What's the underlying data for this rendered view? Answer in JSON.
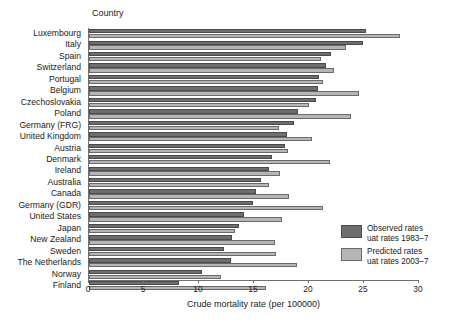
{
  "chart_data": {
    "type": "bar",
    "orientation": "horizontal",
    "title": "",
    "column_header": "Country",
    "xlabel": "Crude mortality rate (per 100000)",
    "ylabel": "",
    "xlim": [
      0,
      30
    ],
    "xticks": [
      0,
      5,
      10,
      15,
      20,
      25,
      30
    ],
    "xtick_labels": [
      "0",
      "5",
      "10",
      "15",
      "20",
      "25",
      "30"
    ],
    "grid": false,
    "legend_position": "inside-lower-right",
    "categories": [
      "Luxembourg",
      "Italy",
      "Spain",
      "Switzerland",
      "Portugal",
      "Belgium",
      "Czechoslovakia",
      "Poland",
      "Germany (FRG)",
      "United Kingdom",
      "Austria",
      "Denmark",
      "Ireland",
      "Australia",
      "Canada",
      "Germany (GDR)",
      "United States",
      "Japan",
      "New Zealand",
      "Sweden",
      "The Netherlands",
      "Norway",
      "Finland"
    ],
    "series": [
      {
        "name": "Observed rates",
        "sublabel": "uat rates 1983–7",
        "color": "#6e6e6e",
        "values": [
          25.2,
          24.9,
          22.0,
          21.5,
          20.9,
          20.8,
          20.6,
          19.0,
          18.6,
          18.0,
          17.8,
          16.6,
          16.4,
          15.6,
          15.2,
          14.9,
          14.1,
          13.6,
          13.0,
          12.3,
          12.9,
          10.3,
          8.2
        ]
      },
      {
        "name": "Predicted rates",
        "sublabel": "uat rates 2003–7",
        "color": "#b6b6b6",
        "values": [
          28.3,
          23.4,
          21.1,
          22.3,
          21.3,
          24.5,
          20.0,
          23.8,
          17.3,
          20.3,
          18.1,
          21.9,
          17.4,
          16.4,
          18.2,
          21.3,
          17.5,
          13.3,
          16.9,
          17.0,
          18.9,
          12.0,
          16.1
        ]
      }
    ]
  },
  "legend": {
    "entries": [
      {
        "name": "Observed rates",
        "sublabel": "uat rates 1983–7"
      },
      {
        "name": "Predicted rates",
        "sublabel": "uat rates 2003–7"
      }
    ]
  }
}
